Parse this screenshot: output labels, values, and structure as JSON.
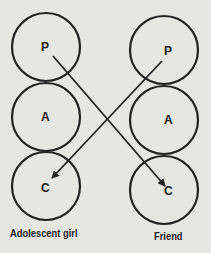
{
  "diagram": {
    "left": {
      "label": "Adolescent girl",
      "nodes": [
        {
          "letter": "P"
        },
        {
          "letter": "A"
        },
        {
          "letter": "C"
        }
      ]
    },
    "right": {
      "label": "Friend",
      "nodes": [
        {
          "letter": "P"
        },
        {
          "letter": "A"
        },
        {
          "letter": "C"
        }
      ]
    },
    "arrows": [
      {
        "from": "Adolescent girl P",
        "to": "Friend C"
      },
      {
        "from": "Friend P",
        "to": "Adolescent girl C"
      }
    ]
  }
}
